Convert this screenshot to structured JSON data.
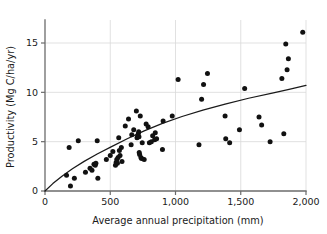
{
  "chart_data": {
    "type": "scatter",
    "title": "",
    "xlabel": "Average annual precipitation (mm)",
    "ylabel": "Productivity (Mg C/ha/yr)",
    "xlim": [
      0,
      2000
    ],
    "ylim": [
      0,
      16.8
    ],
    "xticks": [
      0,
      500,
      1000,
      1500,
      2000
    ],
    "xticklabels": [
      "0",
      "500",
      "1,000",
      "1,500",
      "2,000"
    ],
    "yticks": [
      0,
      5,
      10,
      15
    ],
    "yticklabels": [
      "0",
      "5",
      "10",
      "15"
    ],
    "grid": "both",
    "legend": "none",
    "marker": "filled-circle",
    "marker_color": "#111111",
    "grid_color": "#d9d9d9",
    "axis_color": "#6b6b6b",
    "points": [
      [
        165,
        1.6
      ],
      [
        185,
        4.4
      ],
      [
        195,
        0.5
      ],
      [
        225,
        1.3
      ],
      [
        255,
        5.1
      ],
      [
        310,
        1.9
      ],
      [
        345,
        2.3
      ],
      [
        360,
        2.1
      ],
      [
        375,
        2.7
      ],
      [
        385,
        2.6
      ],
      [
        390,
        2.8
      ],
      [
        400,
        5.1
      ],
      [
        405,
        1.3
      ],
      [
        470,
        3.2
      ],
      [
        500,
        3.6
      ],
      [
        520,
        4.0
      ],
      [
        540,
        2.6
      ],
      [
        545,
        2.9
      ],
      [
        550,
        3.2
      ],
      [
        555,
        2.8
      ],
      [
        560,
        3.4
      ],
      [
        565,
        5.4
      ],
      [
        570,
        4.1
      ],
      [
        575,
        3.6
      ],
      [
        585,
        4.4
      ],
      [
        590,
        3.0
      ],
      [
        615,
        6.6
      ],
      [
        640,
        7.3
      ],
      [
        660,
        4.7
      ],
      [
        665,
        5.7
      ],
      [
        680,
        6.2
      ],
      [
        700,
        8.1
      ],
      [
        705,
        5.4
      ],
      [
        710,
        5.6
      ],
      [
        715,
        5.8
      ],
      [
        718,
        6.0
      ],
      [
        720,
        5.5
      ],
      [
        722,
        3.9
      ],
      [
        725,
        3.7
      ],
      [
        730,
        7.6
      ],
      [
        735,
        3.4
      ],
      [
        740,
        3.3
      ],
      [
        745,
        4.9
      ],
      [
        760,
        3.2
      ],
      [
        775,
        6.8
      ],
      [
        790,
        6.5
      ],
      [
        800,
        4.9
      ],
      [
        815,
        5.0
      ],
      [
        825,
        5.6
      ],
      [
        840,
        5.2
      ],
      [
        845,
        5.9
      ],
      [
        855,
        5.3
      ],
      [
        900,
        4.2
      ],
      [
        905,
        7.1
      ],
      [
        975,
        7.6
      ],
      [
        1020,
        11.3
      ],
      [
        1180,
        4.7
      ],
      [
        1200,
        9.3
      ],
      [
        1215,
        10.8
      ],
      [
        1245,
        11.9
      ],
      [
        1380,
        7.6
      ],
      [
        1385,
        5.3
      ],
      [
        1415,
        4.9
      ],
      [
        1490,
        6.2
      ],
      [
        1530,
        10.4
      ],
      [
        1640,
        7.5
      ],
      [
        1660,
        6.7
      ],
      [
        1725,
        5.0
      ],
      [
        1815,
        11.4
      ],
      [
        1830,
        5.8
      ],
      [
        1845,
        14.9
      ],
      [
        1855,
        12.3
      ],
      [
        1865,
        13.4
      ],
      [
        1975,
        16.1
      ]
    ],
    "trend": {
      "description": "saturating logarithmic fit rising from origin to about 10.7",
      "x": [
        0,
        60,
        130,
        210,
        300,
        400,
        510,
        630,
        760,
        900,
        1050,
        1210,
        1380,
        1560,
        1750,
        1870,
        2000
      ],
      "y": [
        0.0,
        0.75,
        1.5,
        2.25,
        3.0,
        3.75,
        4.5,
        5.3,
        6.1,
        6.85,
        7.55,
        8.2,
        8.8,
        9.4,
        9.95,
        10.3,
        10.7
      ]
    }
  }
}
